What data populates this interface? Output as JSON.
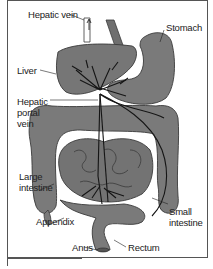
{
  "diagram": {
    "colors": {
      "organ_fill": "#7a7a7a",
      "organ_fill_dark": "#6a6a6a",
      "outline": "#3a3a3a",
      "vessel": "#1a1a1a",
      "background": "#ffffff",
      "text": "#222222"
    },
    "labels": {
      "hepatic_vein": "Hepatic vein",
      "stomach": "Stomach",
      "liver": "Liver",
      "hepatic_portal_vein_1": "Hepatic",
      "hepatic_portal_vein_2": "portal",
      "hepatic_portal_vein_3": "vein",
      "large_intestine_1": "Large",
      "large_intestine_2": "intestine",
      "appendix": "Appendix",
      "small_intestine_1": "Small",
      "small_intestine_2": "intestine",
      "anus": "Anus",
      "rectum": "Rectum"
    }
  }
}
